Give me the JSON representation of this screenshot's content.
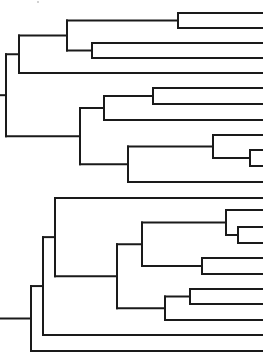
{
  "figure": {
    "type": "dendrogram",
    "orientation": "left-to-right",
    "line_color": "#1a1a1a",
    "background": "#ffffff",
    "leaf_x_end": 262,
    "leaf_count": 23
  },
  "trees": [
    {
      "name": "upper-tree",
      "root_stub": {
        "x1": 0,
        "x2": 6,
        "y": 95
      },
      "nodes": [
        {
          "id": "A0",
          "x": 6,
          "children": [
            "A1",
            "A5"
          ]
        },
        {
          "id": "A1",
          "x": 19,
          "children": [
            "A2",
            "L5"
          ]
        },
        {
          "id": "A2",
          "x": 67,
          "children": [
            "A3",
            "A4"
          ]
        },
        {
          "id": "A3",
          "x": 178,
          "children": [
            "L1",
            "L2"
          ]
        },
        {
          "id": "A4",
          "x": 92,
          "children": [
            "L3",
            "L4"
          ]
        },
        {
          "id": "A5",
          "x": 80,
          "children": [
            "A6",
            "A8"
          ]
        },
        {
          "id": "A6",
          "x": 104,
          "children": [
            "A7",
            "L8"
          ]
        },
        {
          "id": "A7",
          "x": 153,
          "children": [
            "L6",
            "L7"
          ]
        },
        {
          "id": "A8",
          "x": 128,
          "children": [
            "A9",
            "L12"
          ]
        },
        {
          "id": "A9",
          "x": 213,
          "children": [
            "L9",
            "A10"
          ]
        },
        {
          "id": "A10",
          "x": 250,
          "children": [
            "L10",
            "L11"
          ]
        }
      ],
      "leaves": [
        {
          "id": "L1",
          "y": 13
        },
        {
          "id": "L2",
          "y": 28
        },
        {
          "id": "L3",
          "y": 43
        },
        {
          "id": "L4",
          "y": 58
        },
        {
          "id": "L5",
          "y": 73
        },
        {
          "id": "L6",
          "y": 88
        },
        {
          "id": "L7",
          "y": 104
        },
        {
          "id": "L8",
          "y": 120
        },
        {
          "id": "L9",
          "y": 135
        },
        {
          "id": "L10",
          "y": 150
        },
        {
          "id": "L11",
          "y": 166
        },
        {
          "id": "L12",
          "y": 182
        }
      ]
    },
    {
      "name": "lower-tree",
      "root_stub": {
        "x1": 0,
        "x2": 31,
        "y": 321
      },
      "nodes": [
        {
          "id": "B0",
          "x": 31,
          "children": [
            "B1",
            "M11"
          ]
        },
        {
          "id": "B1",
          "x": 43,
          "children": [
            "B2",
            "M10"
          ]
        },
        {
          "id": "B2",
          "x": 55,
          "children": [
            "M1",
            "B3"
          ]
        },
        {
          "id": "B3",
          "x": 117,
          "children": [
            "B4",
            "B7"
          ]
        },
        {
          "id": "B4",
          "x": 142,
          "children": [
            "B5",
            "B6"
          ]
        },
        {
          "id": "B5",
          "x": 226,
          "children": [
            "M2",
            "B5a"
          ]
        },
        {
          "id": "B5a",
          "x": 238,
          "children": [
            "M3",
            "M4"
          ]
        },
        {
          "id": "B6",
          "x": 202,
          "children": [
            "M5",
            "M6"
          ]
        },
        {
          "id": "B7",
          "x": 165,
          "children": [
            "B8",
            "M9"
          ]
        },
        {
          "id": "B8",
          "x": 190,
          "children": [
            "M7",
            "M8"
          ]
        }
      ],
      "leaves": [
        {
          "id": "M1",
          "y": 198
        },
        {
          "id": "M2",
          "y": 210
        },
        {
          "id": "M3",
          "y": 227
        },
        {
          "id": "M4",
          "y": 243
        },
        {
          "id": "M5",
          "y": 258
        },
        {
          "id": "M6",
          "y": 274
        },
        {
          "id": "M7",
          "y": 289
        },
        {
          "id": "M8",
          "y": 304
        },
        {
          "id": "M9",
          "y": 320
        },
        {
          "id": "M10",
          "y": 335
        },
        {
          "id": "M11",
          "y": 351
        }
      ]
    }
  ],
  "artifacts": [
    {
      "name": "scan-speck",
      "x": 38,
      "y": 2
    }
  ]
}
